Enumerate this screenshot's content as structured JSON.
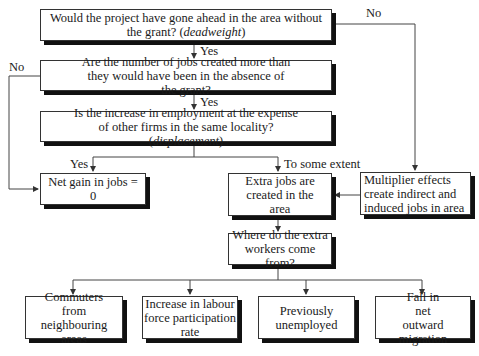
{
  "nodes": {
    "deadweight": {
      "text": "Would the project have gone ahead in the area without the grant?",
      "em": "deadweight"
    },
    "additional": {
      "text": "Are the number of jobs created more than they would have been in the absence of the grant?"
    },
    "displacement": {
      "text": "Is the increase in employment at the expense of other firms in the same locality?",
      "em": "displacement"
    },
    "net_zero": {
      "text": "Net gain in jobs = 0"
    },
    "extra_jobs": {
      "text": "Extra jobs are created in the area"
    },
    "multiplier": {
      "text": "Multiplier effects create indirect and induced jobs in area"
    },
    "where": {
      "text": "Where do the extra workers come from?"
    },
    "sources": [
      {
        "text": "Commuters from neighbouring areas"
      },
      {
        "text": "Increase in labour force participation rate"
      },
      {
        "text": "Previously unemployed"
      },
      {
        "text": "Fall in net outward migration"
      }
    ]
  },
  "edges": {
    "no_right": "No",
    "yes_1": "Yes",
    "no_left": "No",
    "yes_2": "Yes",
    "yes_3": "Yes",
    "some_extent": "To some extent"
  }
}
